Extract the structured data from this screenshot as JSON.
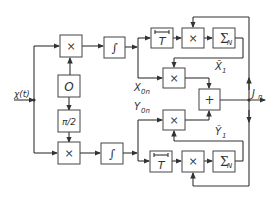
{
  "diagram": {
    "input_label": "χ(t)",
    "output_label": "J",
    "output_sub": "n",
    "blocks": {
      "mult_top": "×",
      "integ_top": "∫",
      "osc": "O",
      "phase": "π/2",
      "mult_bottom": "×",
      "integ_bottom": "∫",
      "delay_top": "T",
      "mult_delay_top": "×",
      "sum_top": "Σ",
      "sum_top_sub": "N",
      "mult_mid_top": "×",
      "adder": "+",
      "mult_mid_bottom": "×",
      "delay_bottom": "T",
      "mult_delay_bottom": "×",
      "sum_bottom": "Σ",
      "sum_bottom_sub": "N"
    },
    "signals": {
      "x0n": "X",
      "x0n_sub": "0n",
      "y0n": "Y",
      "y0n_sub": "0n",
      "x1": "X̃",
      "x1_sub": "1",
      "y1": "Ỹ",
      "y1_sub": "1"
    }
  }
}
